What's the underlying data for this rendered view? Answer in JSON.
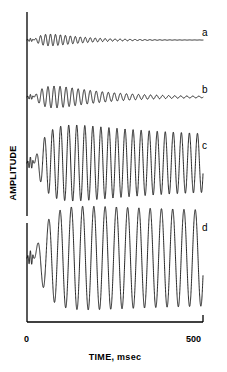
{
  "chart_data": {
    "type": "line",
    "title": "",
    "xlabel": "TIME, msec",
    "ylabel": "AMPLITUDE",
    "xlim": [
      0,
      500
    ],
    "xticks": [
      0,
      500
    ],
    "xtick_labels": [
      "0",
      "500"
    ],
    "yticks": [],
    "grid": false,
    "legend": "none",
    "annotations": [
      "a",
      "b",
      "c",
      "d"
    ],
    "series": [
      {
        "name": "a",
        "label": "a",
        "baseline_y": 40,
        "amplitude": 13,
        "frequency_cycles": 34,
        "decay": "fast",
        "end_state": "flat",
        "onset_msec": 20
      },
      {
        "name": "b",
        "label": "b",
        "baseline_y": 97,
        "amplitude": 20,
        "frequency_cycles": 28,
        "decay": "moderate",
        "end_state": "small-ripple",
        "onset_msec": 20
      },
      {
        "name": "c",
        "label": "c",
        "baseline_y": 163,
        "amplitude": 46,
        "frequency_cycles": 21,
        "decay": "slight",
        "end_state": "sustained",
        "onset_msec": 20
      },
      {
        "name": "d",
        "label": "d",
        "baseline_y": 258,
        "amplitude": 56,
        "frequency_cycles": 15,
        "decay": "minimal",
        "end_state": "sustained",
        "onset_msec": 20
      }
    ]
  },
  "axes": {
    "y_axis_label": "AMPLITUDE",
    "x_axis_label": "TIME, msec",
    "x_tick_min": "0",
    "x_tick_max": "500"
  },
  "colors": {
    "trace": "#000000",
    "axis": "#000000",
    "background": "#ffffff"
  }
}
